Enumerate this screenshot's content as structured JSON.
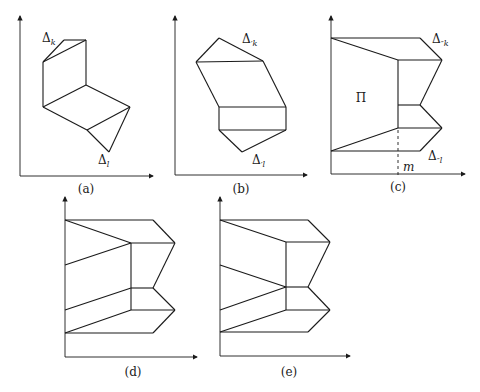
{
  "figure": {
    "panels": [
      {
        "id": "a",
        "caption": "(a)",
        "labels": {
          "top": "Δ",
          "top_sub": "k",
          "bottom": "Δ",
          "bottom_sub": "l"
        }
      },
      {
        "id": "b",
        "caption": "(b)",
        "labels": {
          "top": "Δ",
          "top_sub": "′k",
          "bottom": "Δ",
          "bottom_sub": "′l"
        }
      },
      {
        "id": "c",
        "caption": "(c)",
        "labels": {
          "top": "Δ",
          "top_sub": "″k",
          "bottom": "Δ",
          "bottom_sub": "″l",
          "region": "Π",
          "axis_mark": "m"
        }
      },
      {
        "id": "d",
        "caption": "(d)"
      },
      {
        "id": "e",
        "caption": "(e)"
      }
    ]
  }
}
